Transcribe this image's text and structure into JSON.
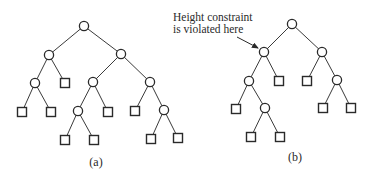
{
  "figure": {
    "trees": [
      {
        "id": "a",
        "caption": "(a)",
        "caption_pos": [
          96,
          166
        ],
        "nodes": [
          {
            "id": "r",
            "type": "internal",
            "x": 84,
            "y": 26
          },
          {
            "id": "l",
            "type": "internal",
            "x": 49,
            "y": 55
          },
          {
            "id": "rt",
            "type": "internal",
            "x": 121,
            "y": 54
          },
          {
            "id": "ll",
            "type": "internal",
            "x": 35,
            "y": 83
          },
          {
            "id": "lr",
            "type": "leaf",
            "x": 65,
            "y": 83
          },
          {
            "id": "rl",
            "type": "internal",
            "x": 93,
            "y": 82
          },
          {
            "id": "rr",
            "type": "internal",
            "x": 150,
            "y": 82
          },
          {
            "id": "lll",
            "type": "leaf",
            "x": 22,
            "y": 112
          },
          {
            "id": "llr",
            "type": "leaf",
            "x": 51,
            "y": 112
          },
          {
            "id": "rll",
            "type": "internal",
            "x": 78,
            "y": 111
          },
          {
            "id": "rlr",
            "type": "leaf",
            "x": 108,
            "y": 112
          },
          {
            "id": "rrl",
            "type": "leaf",
            "x": 135,
            "y": 111
          },
          {
            "id": "rrr",
            "type": "internal",
            "x": 164,
            "y": 110
          },
          {
            "id": "rlll",
            "type": "leaf",
            "x": 65,
            "y": 140
          },
          {
            "id": "rllr",
            "type": "leaf",
            "x": 94,
            "y": 140
          },
          {
            "id": "rrrl",
            "type": "leaf",
            "x": 151,
            "y": 139
          },
          {
            "id": "rrrr",
            "type": "leaf",
            "x": 178,
            "y": 138
          }
        ],
        "edges": [
          [
            "r",
            "l"
          ],
          [
            "r",
            "rt"
          ],
          [
            "l",
            "ll"
          ],
          [
            "l",
            "lr"
          ],
          [
            "rt",
            "rl"
          ],
          [
            "rt",
            "rr"
          ],
          [
            "ll",
            "lll"
          ],
          [
            "ll",
            "llr"
          ],
          [
            "rl",
            "rll"
          ],
          [
            "rl",
            "rlr"
          ],
          [
            "rr",
            "rrl"
          ],
          [
            "rr",
            "rrr"
          ],
          [
            "rll",
            "rlll"
          ],
          [
            "rll",
            "rllr"
          ],
          [
            "rrr",
            "rrrl"
          ],
          [
            "rrr",
            "rrrr"
          ]
        ]
      },
      {
        "id": "b",
        "caption": "(b)",
        "caption_pos": [
          295,
          161
        ],
        "nodes": [
          {
            "id": "r",
            "type": "internal",
            "x": 292,
            "y": 24
          },
          {
            "id": "l",
            "type": "internal",
            "x": 264,
            "y": 52,
            "violated": true
          },
          {
            "id": "rt",
            "type": "internal",
            "x": 322,
            "y": 52
          },
          {
            "id": "ll",
            "type": "internal",
            "x": 249,
            "y": 81
          },
          {
            "id": "lr",
            "type": "leaf",
            "x": 279,
            "y": 81
          },
          {
            "id": "rl",
            "type": "leaf",
            "x": 307,
            "y": 81
          },
          {
            "id": "rr",
            "type": "internal",
            "x": 337,
            "y": 80
          },
          {
            "id": "lll",
            "type": "leaf",
            "x": 236,
            "y": 109
          },
          {
            "id": "llr",
            "type": "internal",
            "x": 265,
            "y": 108
          },
          {
            "id": "rrl",
            "type": "leaf",
            "x": 323,
            "y": 108
          },
          {
            "id": "rrr",
            "type": "leaf",
            "x": 351,
            "y": 108
          },
          {
            "id": "llrl",
            "type": "leaf",
            "x": 251,
            "y": 137
          },
          {
            "id": "llrr",
            "type": "leaf",
            "x": 280,
            "y": 137
          }
        ],
        "edges": [
          [
            "r",
            "l"
          ],
          [
            "r",
            "rt"
          ],
          [
            "l",
            "ll"
          ],
          [
            "l",
            "lr"
          ],
          [
            "rt",
            "rl"
          ],
          [
            "rt",
            "rr"
          ],
          [
            "ll",
            "lll"
          ],
          [
            "ll",
            "llr"
          ],
          [
            "rr",
            "rrl"
          ],
          [
            "rr",
            "rrr"
          ],
          [
            "llr",
            "llrl"
          ],
          [
            "llr",
            "llrr"
          ]
        ],
        "annotation": {
          "lines": [
            "Height constraint",
            "is violated here"
          ],
          "x": 173,
          "y": [
            21,
            33
          ],
          "arrow_from": [
            237,
            37
          ],
          "arrow_to": [
            258,
            48
          ]
        }
      }
    ],
    "legend": {
      "internal_node_shape": "circle",
      "leaf_node_shape": "square"
    },
    "colors": {
      "stroke": "#2a2a2a",
      "background": "#ffffff"
    }
  }
}
